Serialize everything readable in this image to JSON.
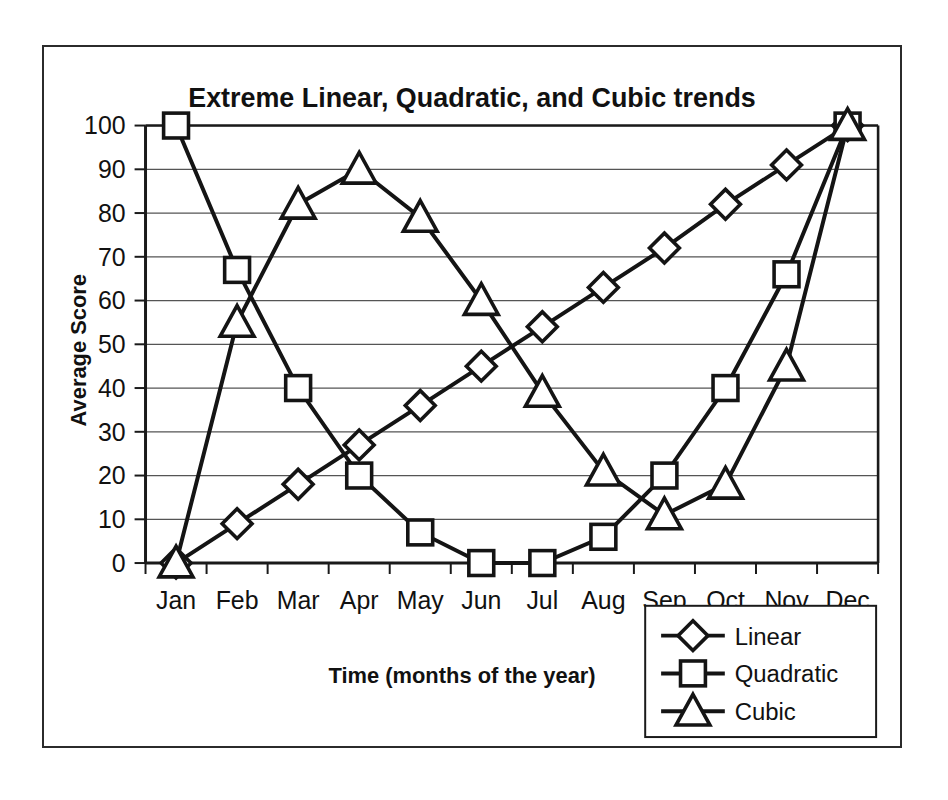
{
  "chart_data": {
    "type": "line",
    "title": "Extreme Linear, Quadratic, and Cubic trends",
    "xlabel": "Time (months of the year)",
    "ylabel": "Average Score",
    "categories": [
      "Jan",
      "Feb",
      "Mar",
      "Apr",
      "May",
      "Jun",
      "Jul",
      "Aug",
      "Sep",
      "Oct",
      "Nov",
      "Dec"
    ],
    "ylim": [
      0,
      100
    ],
    "yticks": [
      0,
      10,
      20,
      30,
      40,
      50,
      60,
      70,
      80,
      90,
      100
    ],
    "ytick_labels": [
      "0",
      "10",
      "20",
      "30",
      "40",
      "50",
      "60",
      "70",
      "80",
      "90",
      "100"
    ],
    "grid": true,
    "legend_position": "bottom-right",
    "series": [
      {
        "name": "Linear",
        "marker": "diamond",
        "values": [
          0,
          9,
          18,
          27,
          36,
          45,
          54,
          63,
          72,
          82,
          91,
          100
        ]
      },
      {
        "name": "Quadratic",
        "marker": "square",
        "values": [
          100,
          67,
          40,
          20,
          7,
          0,
          0,
          6,
          20,
          40,
          66,
          100
        ]
      },
      {
        "name": "Cubic",
        "marker": "triangle",
        "values": [
          0,
          55,
          82,
          90,
          79,
          60,
          39,
          21,
          11,
          18,
          45,
          100
        ]
      }
    ],
    "colors": {
      "line": "#141414",
      "marker_fill": "#ffffff",
      "grid": "#555555",
      "axis": "#1a1a1a",
      "text": "#111111",
      "background": "#ffffff"
    }
  },
  "legend": {
    "items": [
      {
        "label": "Linear"
      },
      {
        "label": "Quadratic"
      },
      {
        "label": "Cubic"
      }
    ]
  }
}
